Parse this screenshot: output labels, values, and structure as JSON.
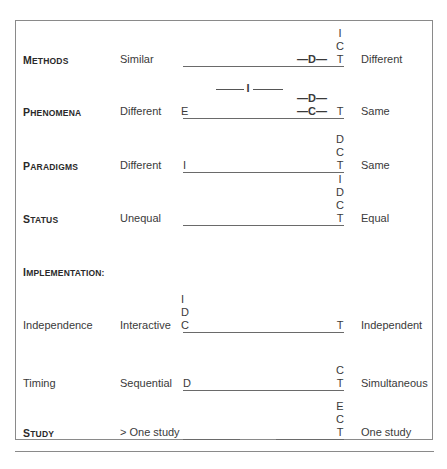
{
  "rows": [
    {
      "label": "Methods",
      "label_first": "M",
      "label_rest": "ETHODS",
      "left": "Similar",
      "right": "Different",
      "stack": [
        "I",
        "C",
        "T"
      ],
      "inline_marks": [
        {
          "text": "—D—"
        }
      ]
    },
    {
      "label": "Phenomena",
      "label_first": "P",
      "label_rest": "HENOMENA",
      "left": "Different",
      "right": "Same",
      "start_mark": "E",
      "stack": [
        "T"
      ],
      "inline_marks": [
        {
          "text": "—D—"
        },
        {
          "text": "—C—"
        }
      ],
      "range_mark": "I"
    },
    {
      "label": "Paradigms",
      "label_first": "P",
      "label_rest": "ARADIGMS",
      "left": "Different",
      "right": "Same",
      "start_mark": "I",
      "stack": [
        "D",
        "C",
        "T"
      ]
    },
    {
      "label": "Status",
      "label_first": "S",
      "label_rest": "TATUS",
      "left": "Unequal",
      "right": "Equal",
      "stack": [
        "I",
        "D",
        "C",
        "T"
      ]
    },
    {
      "label": "Independence",
      "left": "Interactive",
      "right": "Independent",
      "start_stack": [
        "I",
        "D",
        "C"
      ],
      "stack": [
        "T"
      ]
    },
    {
      "label": "Timing",
      "left": "Sequential",
      "right": "Simultaneous",
      "start_mark": "D",
      "stack": [
        "C",
        "T"
      ]
    },
    {
      "label": "Study",
      "label_first": "S",
      "label_rest": "TUDY",
      "left": "> One study",
      "right": "One study",
      "stack": [
        "E",
        "C",
        "T"
      ]
    }
  ],
  "section_heading": {
    "first": "I",
    "rest": "MPLEMENTATION:"
  }
}
